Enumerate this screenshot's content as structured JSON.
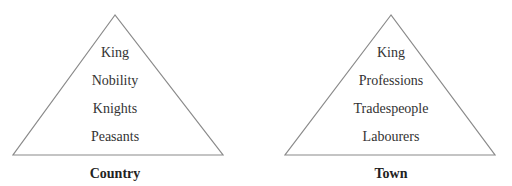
{
  "diagram": {
    "type": "pyramid-comparison",
    "line_color": "#8a8a8a",
    "text_color": "#333333",
    "pyramids": [
      {
        "caption": "Country",
        "levels": [
          "King",
          "Nobility",
          "Knights",
          "Peasants"
        ]
      },
      {
        "caption": "Town",
        "levels": [
          "King",
          "Professions",
          "Tradespeople",
          "Labourers"
        ]
      }
    ]
  }
}
